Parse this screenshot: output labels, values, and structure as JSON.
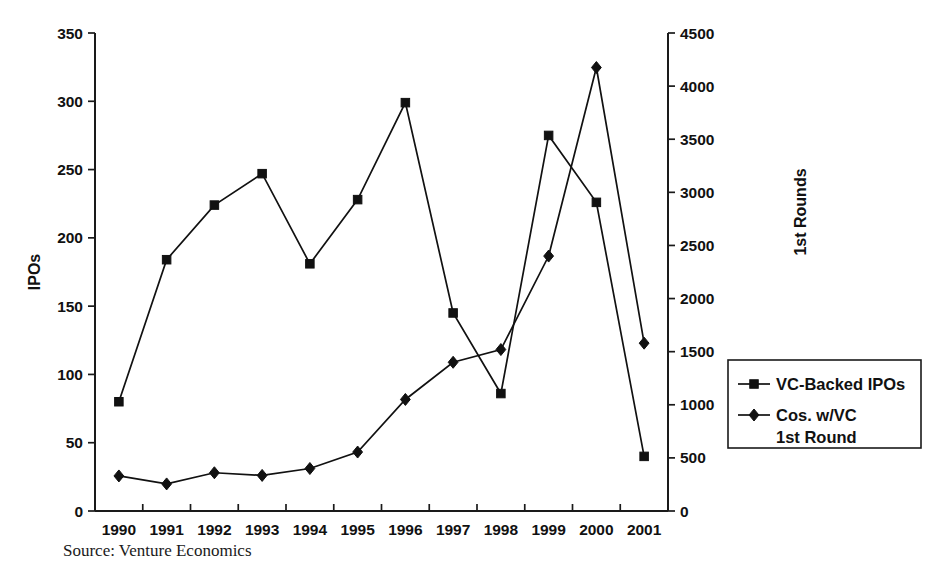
{
  "source_note": "Source: Venture Economics",
  "axes": {
    "left": {
      "title": "IPOs",
      "ticks": [
        "0",
        "50",
        "100",
        "150",
        "200",
        "250",
        "300",
        "350"
      ],
      "min": 0,
      "max": 350
    },
    "right": {
      "title": "1st Rounds",
      "ticks": [
        "0",
        "500",
        "1000",
        "1500",
        "2000",
        "2500",
        "3000",
        "3500",
        "4000",
        "4500"
      ],
      "min": 0,
      "max": 4500
    },
    "bottom": {
      "ticks": [
        "1990",
        "1991",
        "1992",
        "1993",
        "1994",
        "1995",
        "1996",
        "1997",
        "1998",
        "1999",
        "2000",
        "2001"
      ]
    }
  },
  "legend": {
    "position": "right",
    "entries": [
      {
        "label": "VC-Backed IPOs",
        "marker": "square",
        "color": "#111111"
      },
      {
        "label": "Cos. w/VC",
        "label2": "1st Round",
        "marker": "diamond",
        "color": "#111111"
      }
    ]
  },
  "chart_data": {
    "type": "line",
    "title": "",
    "xlabel": "",
    "ylabel": "IPOs",
    "y2label": "1st Rounds",
    "grid": false,
    "legend_position": "right",
    "x": [
      "1990",
      "1991",
      "1992",
      "1993",
      "1994",
      "1995",
      "1996",
      "1997",
      "1998",
      "1999",
      "2000",
      "2001"
    ],
    "ylim": [
      0,
      350
    ],
    "y2lim": [
      0,
      4500
    ],
    "series": [
      {
        "name": "VC-Backed IPOs",
        "axis": "left",
        "marker": "square",
        "values": [
          80,
          184,
          224,
          247,
          181,
          228,
          299,
          145,
          86,
          275,
          226,
          40
        ]
      },
      {
        "name": "Cos. w/VC 1st Round",
        "axis": "right",
        "marker": "diamond",
        "values": [
          330,
          255,
          360,
          335,
          400,
          555,
          1050,
          1400,
          1520,
          2400,
          4175,
          1580
        ]
      }
    ]
  }
}
